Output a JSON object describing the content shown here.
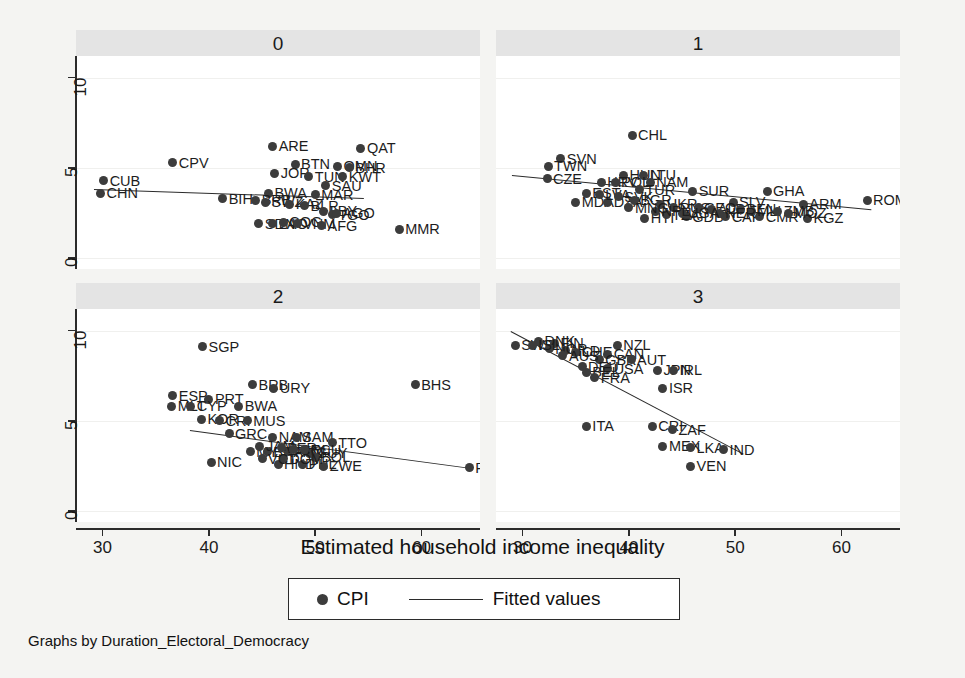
{
  "chart_data": {
    "type": "scatter",
    "title": "",
    "xlabel": "Estimated household income inequality",
    "ylabel": "",
    "caption": "Graphs by Duration_Electoral_Democracy",
    "xlim": [
      27.5,
      65.5
    ],
    "ylim": [
      -0.6,
      11.2
    ],
    "xticks": [
      30,
      40,
      50,
      60
    ],
    "yticks": [
      0,
      5,
      10
    ],
    "grid": "horizontal-faint",
    "legend": {
      "position": "bottom-center",
      "boxed": true,
      "entries": [
        {
          "label": "CPI",
          "marker": "filled-circle"
        },
        {
          "label": "Fitted values",
          "marker": "line"
        }
      ]
    },
    "point_color": "#3c3c3c",
    "line_color": "#2b2b2b",
    "strip_color": "#e4e4e4",
    "panel_by": "Duration_Electoral_Democracy",
    "panels": [
      {
        "strip_label": "0",
        "fit": {
          "x0": 29.2,
          "y0": 3.85,
          "x1": 54.6,
          "y1": 3.35
        },
        "points": [
          {
            "code": "CUB",
            "x": 30.1,
            "y": 4.3
          },
          {
            "code": "CHN",
            "x": 29.8,
            "y": 3.6
          },
          {
            "code": "CPV",
            "x": 36.6,
            "y": 5.3
          },
          {
            "code": "ARE",
            "x": 46.0,
            "y": 6.2
          },
          {
            "code": "QAT",
            "x": 54.3,
            "y": 6.1
          },
          {
            "code": "BTN",
            "x": 48.1,
            "y": 5.2
          },
          {
            "code": "OMN",
            "x": 52.1,
            "y": 5.1
          },
          {
            "code": "BHR",
            "x": 53.2,
            "y": 5.0
          },
          {
            "code": "JOR",
            "x": 46.2,
            "y": 4.7
          },
          {
            "code": "TUN",
            "x": 49.4,
            "y": 4.5
          },
          {
            "code": "KWT",
            "x": 52.6,
            "y": 4.5
          },
          {
            "code": "SAU",
            "x": 51.0,
            "y": 4.0
          },
          {
            "code": "MAR",
            "x": 50.0,
            "y": 3.5
          },
          {
            "code": "BIH",
            "x": 41.3,
            "y": 3.3
          },
          {
            "code": "BWA",
            "x": 45.6,
            "y": 3.6
          },
          {
            "code": "BRB",
            "x": 44.4,
            "y": 3.2
          },
          {
            "code": "SWZ",
            "x": 45.3,
            "y": 3.1
          },
          {
            "code": "KAZ",
            "x": 47.6,
            "y": 3.0
          },
          {
            "code": "BLR",
            "x": 49.0,
            "y": 2.9
          },
          {
            "code": "LBY",
            "x": 50.8,
            "y": 2.6
          },
          {
            "code": "TGO",
            "x": 51.6,
            "y": 2.4
          },
          {
            "code": "AGO",
            "x": 52.0,
            "y": 2.5
          },
          {
            "code": "SDN",
            "x": 44.7,
            "y": 1.9
          },
          {
            "code": "LAO",
            "x": 46.0,
            "y": 1.9
          },
          {
            "code": "COG",
            "x": 47.0,
            "y": 2.0
          },
          {
            "code": "VNM",
            "x": 48.3,
            "y": 1.9
          },
          {
            "code": "AFG",
            "x": 50.6,
            "y": 1.8
          },
          {
            "code": "MMR",
            "x": 57.9,
            "y": 1.6
          }
        ]
      },
      {
        "strip_label": "1",
        "fit": {
          "x0": 29.0,
          "y0": 4.6,
          "x1": 62.8,
          "y1": 2.7
        },
        "points": [
          {
            "code": "CHL",
            "x": 40.3,
            "y": 6.8
          },
          {
            "code": "SVN",
            "x": 33.6,
            "y": 5.5
          },
          {
            "code": "TWN",
            "x": 32.4,
            "y": 5.1
          },
          {
            "code": "CZE",
            "x": 32.3,
            "y": 4.4
          },
          {
            "code": "HUN",
            "x": 39.5,
            "y": 4.6
          },
          {
            "code": "LTU",
            "x": 41.4,
            "y": 4.6
          },
          {
            "code": "HRV",
            "x": 37.4,
            "y": 4.2
          },
          {
            "code": "POL",
            "x": 38.7,
            "y": 4.2
          },
          {
            "code": "NAM",
            "x": 42.0,
            "y": 4.2
          },
          {
            "code": "TUR",
            "x": 41.0,
            "y": 3.8
          },
          {
            "code": "SUR",
            "x": 46.0,
            "y": 3.7
          },
          {
            "code": "GHA",
            "x": 53.0,
            "y": 3.7
          },
          {
            "code": "MDA",
            "x": 35.0,
            "y": 3.1
          },
          {
            "code": "DZA",
            "x": 38.0,
            "y": 3.1
          },
          {
            "code": "ARM",
            "x": 56.4,
            "y": 3.0
          },
          {
            "code": "SLV",
            "x": 49.8,
            "y": 3.1
          },
          {
            "code": "HTI",
            "x": 41.5,
            "y": 2.2
          },
          {
            "code": "GDB",
            "x": 45.4,
            "y": 2.3
          },
          {
            "code": "CAF",
            "x": 49.1,
            "y": 2.3
          },
          {
            "code": "CMR",
            "x": 52.3,
            "y": 2.3
          },
          {
            "code": "KGZ",
            "x": 56.8,
            "y": 2.2
          },
          {
            "code": "ROM",
            "x": 62.4,
            "y": 3.2
          },
          {
            "code": "EST",
            "x": 36.0,
            "y": 3.6
          },
          {
            "code": "LVA",
            "x": 37.2,
            "y": 3.5
          },
          {
            "code": "SVK",
            "x": 39.0,
            "y": 3.4
          },
          {
            "code": "BGR",
            "x": 40.5,
            "y": 3.2
          },
          {
            "code": "UKR",
            "x": 43.0,
            "y": 3.0
          },
          {
            "code": "RUS",
            "x": 44.2,
            "y": 2.8
          },
          {
            "code": "GEO",
            "x": 46.5,
            "y": 2.8
          },
          {
            "code": "ALB",
            "x": 47.8,
            "y": 2.7
          },
          {
            "code": "BEN",
            "x": 50.5,
            "y": 2.7
          },
          {
            "code": "MLI",
            "x": 51.5,
            "y": 2.6
          },
          {
            "code": "NER",
            "x": 48.5,
            "y": 2.5
          },
          {
            "code": "TZA",
            "x": 43.5,
            "y": 2.4
          },
          {
            "code": "UGA",
            "x": 45.0,
            "y": 2.5
          },
          {
            "code": "ZMB",
            "x": 54.0,
            "y": 2.6
          },
          {
            "code": "MOZ",
            "x": 55.0,
            "y": 2.5
          },
          {
            "code": "NPL",
            "x": 42.5,
            "y": 2.6
          },
          {
            "code": "MNG",
            "x": 40.0,
            "y": 2.8
          }
        ]
      },
      {
        "strip_label": "2",
        "fit": {
          "x0": 38.2,
          "y0": 4.5,
          "x1": 64.6,
          "y1": 2.4
        },
        "points": [
          {
            "code": "SGP",
            "x": 39.4,
            "y": 9.1
          },
          {
            "code": "BRB",
            "x": 44.1,
            "y": 7.0
          },
          {
            "code": "URY",
            "x": 46.1,
            "y": 6.8
          },
          {
            "code": "BHS",
            "x": 59.4,
            "y": 7.0
          },
          {
            "code": "ESP",
            "x": 36.6,
            "y": 6.4
          },
          {
            "code": "PRT",
            "x": 40.0,
            "y": 6.2
          },
          {
            "code": "MLT",
            "x": 36.5,
            "y": 5.8
          },
          {
            "code": "CYP",
            "x": 38.3,
            "y": 5.8
          },
          {
            "code": "BWA",
            "x": 42.8,
            "y": 5.8
          },
          {
            "code": "KOR",
            "x": 39.3,
            "y": 5.1
          },
          {
            "code": "CRI",
            "x": 41.0,
            "y": 5.0
          },
          {
            "code": "MUS",
            "x": 43.6,
            "y": 5.0
          },
          {
            "code": "GRC",
            "x": 41.9,
            "y": 4.3
          },
          {
            "code": "NAM",
            "x": 46.0,
            "y": 4.1
          },
          {
            "code": "SAM",
            "x": 48.2,
            "y": 4.1
          },
          {
            "code": "TTO",
            "x": 51.6,
            "y": 3.8
          },
          {
            "code": "MYS",
            "x": 43.9,
            "y": 3.3
          },
          {
            "code": "BRA",
            "x": 45.5,
            "y": 3.3
          },
          {
            "code": "PAN",
            "x": 47.5,
            "y": 3.3
          },
          {
            "code": "GUY",
            "x": 49.5,
            "y": 3.2
          },
          {
            "code": "NIC",
            "x": 40.2,
            "y": 2.7
          },
          {
            "code": "HND",
            "x": 46.5,
            "y": 2.6
          },
          {
            "code": "PHL",
            "x": 48.8,
            "y": 2.6
          },
          {
            "code": "ZWE",
            "x": 50.8,
            "y": 2.5
          },
          {
            "code": "PRY",
            "x": 64.5,
            "y": 2.4
          },
          {
            "code": "JAM",
            "x": 44.8,
            "y": 3.6
          },
          {
            "code": "PER",
            "x": 46.8,
            "y": 3.5
          },
          {
            "code": "COL",
            "x": 48.0,
            "y": 3.4
          },
          {
            "code": "ECU",
            "x": 49.0,
            "y": 3.4
          },
          {
            "code": "BOL",
            "x": 50.0,
            "y": 3.0
          },
          {
            "code": "DOM",
            "x": 47.0,
            "y": 2.9
          },
          {
            "code": "VCT",
            "x": 45.0,
            "y": 2.9
          }
        ]
      },
      {
        "strip_label": "3",
        "fit": {
          "x0": 28.9,
          "y0": 10.0,
          "x1": 50.8,
          "y1": 3.2
        },
        "points": [
          {
            "code": "SWE",
            "x": 29.3,
            "y": 9.2
          },
          {
            "code": "FIN",
            "x": 33.0,
            "y": 9.3
          },
          {
            "code": "DNK",
            "x": 31.5,
            "y": 9.4
          },
          {
            "code": "NZL",
            "x": 38.9,
            "y": 9.2
          },
          {
            "code": "NLD",
            "x": 34.0,
            "y": 8.9
          },
          {
            "code": "NOR",
            "x": 32.5,
            "y": 9.0
          },
          {
            "code": "CHE",
            "x": 35.0,
            "y": 8.8
          },
          {
            "code": "CAN",
            "x": 38.0,
            "y": 8.7
          },
          {
            "code": "GBR",
            "x": 37.2,
            "y": 8.4
          },
          {
            "code": "AUT",
            "x": 40.2,
            "y": 8.4
          },
          {
            "code": "DEU",
            "x": 35.6,
            "y": 8.0
          },
          {
            "code": "USA",
            "x": 38.0,
            "y": 7.9
          },
          {
            "code": "BEL",
            "x": 36.0,
            "y": 7.7
          },
          {
            "code": "FRA",
            "x": 36.8,
            "y": 7.4
          },
          {
            "code": "JPN",
            "x": 42.7,
            "y": 7.8
          },
          {
            "code": "IRL",
            "x": 44.2,
            "y": 7.8
          },
          {
            "code": "ISR",
            "x": 43.2,
            "y": 6.8
          },
          {
            "code": "ITA",
            "x": 36.0,
            "y": 4.7
          },
          {
            "code": "CRI",
            "x": 42.2,
            "y": 4.7
          },
          {
            "code": "ZAF",
            "x": 44.1,
            "y": 4.5
          },
          {
            "code": "MEX",
            "x": 43.2,
            "y": 3.6
          },
          {
            "code": "LKA",
            "x": 45.8,
            "y": 3.5
          },
          {
            "code": "IND",
            "x": 48.9,
            "y": 3.4
          },
          {
            "code": "VEN",
            "x": 45.8,
            "y": 2.5
          },
          {
            "code": "AUS",
            "x": 33.8,
            "y": 8.6
          },
          {
            "code": "ISL",
            "x": 30.9,
            "y": 9.2
          }
        ]
      }
    ]
  }
}
